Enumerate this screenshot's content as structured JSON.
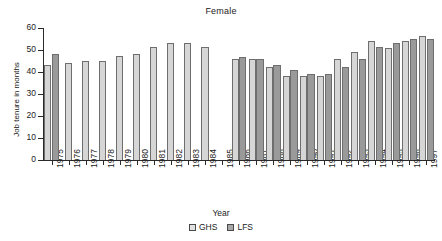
{
  "chart_data": {
    "type": "bar",
    "title": "Female",
    "xlabel": "Year",
    "ylabel": "Job tenure in months",
    "ylim": [
      0,
      60
    ],
    "yticks": [
      0,
      10,
      20,
      30,
      40,
      50,
      60
    ],
    "grid": false,
    "legend_position": "bottom-center",
    "categories": [
      "1975",
      "1976",
      "1977",
      "1978",
      "1979",
      "1980",
      "1981",
      "1982",
      "1983",
      "1984",
      "1985",
      "1986",
      "1987",
      "1988",
      "1989",
      "1990",
      "1991",
      "1992",
      "1993",
      "1994",
      "1995",
      "1996",
      "1997"
    ],
    "series": [
      {
        "name": "GHS",
        "color": "#d6d6d6",
        "values": [
          43.2,
          44.2,
          45.2,
          45.2,
          47.1,
          48.2,
          51.2,
          53.3,
          53.3,
          51.2,
          null,
          46.0,
          46.1,
          42.1,
          38.2,
          38.2,
          38.2,
          46.1,
          49.2,
          54.2,
          51.0,
          54.2,
          56.4
        ]
      },
      {
        "name": "LFS",
        "color": "#9a9a9a",
        "values": [
          48.2,
          null,
          null,
          null,
          null,
          null,
          null,
          null,
          null,
          null,
          null,
          47.0,
          46.1,
          43.1,
          41.1,
          39.1,
          39.2,
          42.1,
          46.1,
          51.2,
          53.1,
          55.1,
          55.1
        ]
      }
    ]
  },
  "legend": {
    "items": [
      {
        "label": "GHS",
        "key": "ghs"
      },
      {
        "label": "LFS",
        "key": "lfs"
      }
    ]
  }
}
